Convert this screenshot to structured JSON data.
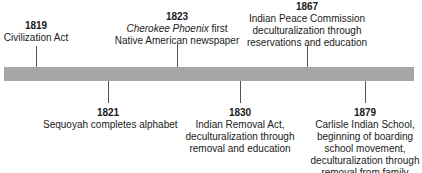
{
  "timeline": {
    "bar_color": "#a6a6a6",
    "events_above": [
      {
        "year": "1819",
        "lines": [
          "Civilization Act"
        ]
      },
      {
        "year": "1823",
        "italic": "Cherokee Phoenix",
        "lines": [
          " first",
          "Native American newspaper"
        ]
      },
      {
        "year": "1867",
        "lines": [
          "Indian Peace Commission",
          "deculturalization through",
          "reservations and education"
        ]
      }
    ],
    "events_below": [
      {
        "year": "1821",
        "lines": [
          "Sequoyah completes alphabet"
        ]
      },
      {
        "year": "1830",
        "lines": [
          "Indian Removal Act,",
          "deculturalization through",
          "removal and education"
        ]
      },
      {
        "year": "1879",
        "lines": [
          "Carlisle Indian School,",
          "beginning of boarding",
          "school movement,",
          "deculturalization through",
          "removal from family"
        ]
      }
    ]
  }
}
